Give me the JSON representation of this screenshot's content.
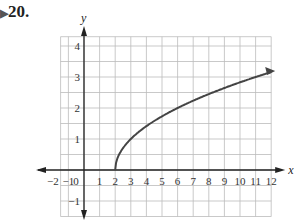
{
  "problem": {
    "marker": "▶",
    "number": "20."
  },
  "chart_data": {
    "type": "line",
    "title": "",
    "xlabel": "x",
    "ylabel": "y",
    "xlim": [
      -2,
      12
    ],
    "ylim": [
      -1,
      4
    ],
    "x_ticks": [
      "-2",
      "-1",
      "0",
      "1",
      "2",
      "3",
      "4",
      "5",
      "6",
      "7",
      "8",
      "9",
      "10",
      "11",
      "12"
    ],
    "y_ticks": [
      "-1",
      "1",
      "2",
      "3",
      "4"
    ],
    "grid": true,
    "series": [
      {
        "name": "y = sqrt(x - 2)",
        "x": [
          2,
          2.25,
          3,
          4,
          6,
          8,
          10,
          12
        ],
        "y": [
          0,
          0.5,
          1,
          1.41,
          2,
          2.45,
          2.83,
          3.16
        ],
        "end_arrow": true
      }
    ],
    "colors": {
      "curve": "#444444",
      "grid": "#bbbbbb",
      "axis": "#222222"
    }
  }
}
